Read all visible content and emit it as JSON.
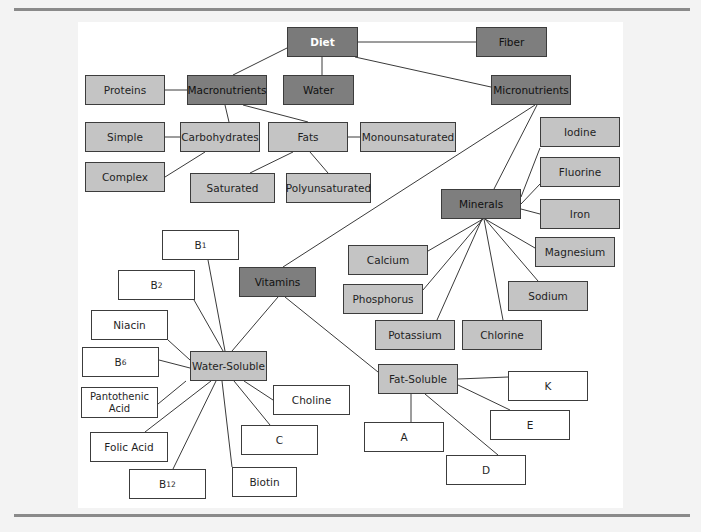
{
  "diagram": {
    "title": "Diet",
    "colors": {
      "dark_node": "#7a7a7a",
      "light_node": "#c4c4c4",
      "white_node": "#ffffff",
      "edge": "#3a3a3a",
      "rule": "#8a8a8a"
    },
    "nodes": {
      "diet": {
        "label": "Diet",
        "level": "root"
      },
      "fiber": {
        "label": "Fiber",
        "level": "category"
      },
      "water": {
        "label": "Water",
        "level": "category"
      },
      "macronutrients": {
        "label": "Macronutrients",
        "level": "category"
      },
      "micronutrients": {
        "label": "Micronutrients",
        "level": "category"
      },
      "proteins": {
        "label": "Proteins",
        "level": "subcategory"
      },
      "carbohydrates": {
        "label": "Carbohydrates",
        "level": "subcategory"
      },
      "fats": {
        "label": "Fats",
        "level": "subcategory"
      },
      "simple": {
        "label": "Simple",
        "level": "subcategory"
      },
      "complex": {
        "label": "Complex",
        "level": "subcategory"
      },
      "monounsaturated": {
        "label": "Monounsaturated",
        "level": "subcategory"
      },
      "saturated": {
        "label": "Saturated",
        "level": "subcategory"
      },
      "polyunsaturated": {
        "label": "Polyunsaturated",
        "level": "subcategory"
      },
      "minerals": {
        "label": "Minerals",
        "level": "category"
      },
      "iodine": {
        "label": "Iodine",
        "level": "subcategory"
      },
      "fluorine": {
        "label": "Fluorine",
        "level": "subcategory"
      },
      "iron": {
        "label": "Iron",
        "level": "subcategory"
      },
      "calcium": {
        "label": "Calcium",
        "level": "subcategory"
      },
      "magnesium": {
        "label": "Magnesium",
        "level": "subcategory"
      },
      "phosphorus": {
        "label": "Phosphorus",
        "level": "subcategory"
      },
      "sodium": {
        "label": "Sodium",
        "level": "subcategory"
      },
      "potassium": {
        "label": "Potassium",
        "level": "subcategory"
      },
      "chlorine": {
        "label": "Chlorine",
        "level": "subcategory"
      },
      "vitamins": {
        "label": "Vitamins",
        "level": "category"
      },
      "water_soluble": {
        "label": "Water-Soluble",
        "level": "subcategory"
      },
      "fat_soluble": {
        "label": "Fat-Soluble",
        "level": "subcategory"
      },
      "b1": {
        "label": "B",
        "sub": "1",
        "level": "leaf"
      },
      "b2": {
        "label": "B",
        "sub": "2",
        "level": "leaf"
      },
      "niacin": {
        "label": "Niacin",
        "level": "leaf"
      },
      "b6": {
        "label": "B",
        "sub": "6",
        "level": "leaf"
      },
      "pantothenic_acid": {
        "label": "Pantothenic Acid",
        "level": "leaf"
      },
      "folic_acid": {
        "label": "Folic Acid",
        "level": "leaf"
      },
      "b12": {
        "label": "B",
        "sub": "12",
        "level": "leaf"
      },
      "biotin": {
        "label": "Biotin",
        "level": "leaf"
      },
      "c": {
        "label": "C",
        "level": "leaf"
      },
      "choline": {
        "label": "Choline",
        "level": "leaf"
      },
      "a": {
        "label": "A",
        "level": "leaf"
      },
      "d": {
        "label": "D",
        "level": "leaf"
      },
      "e": {
        "label": "E",
        "level": "leaf"
      },
      "k": {
        "label": "K",
        "level": "leaf"
      }
    },
    "edges": [
      [
        "diet",
        "fiber"
      ],
      [
        "diet",
        "water"
      ],
      [
        "diet",
        "macronutrients"
      ],
      [
        "diet",
        "micronutrients"
      ],
      [
        "macronutrients",
        "proteins"
      ],
      [
        "macronutrients",
        "carbohydrates"
      ],
      [
        "macronutrients",
        "fats"
      ],
      [
        "carbohydrates",
        "simple"
      ],
      [
        "carbohydrates",
        "complex"
      ],
      [
        "fats",
        "monounsaturated"
      ],
      [
        "fats",
        "saturated"
      ],
      [
        "fats",
        "polyunsaturated"
      ],
      [
        "micronutrients",
        "minerals"
      ],
      [
        "micronutrients",
        "vitamins"
      ],
      [
        "minerals",
        "iodine"
      ],
      [
        "minerals",
        "fluorine"
      ],
      [
        "minerals",
        "iron"
      ],
      [
        "minerals",
        "calcium"
      ],
      [
        "minerals",
        "magnesium"
      ],
      [
        "minerals",
        "phosphorus"
      ],
      [
        "minerals",
        "sodium"
      ],
      [
        "minerals",
        "potassium"
      ],
      [
        "minerals",
        "chlorine"
      ],
      [
        "vitamins",
        "water_soluble"
      ],
      [
        "vitamins",
        "fat_soluble"
      ],
      [
        "water_soluble",
        "b1"
      ],
      [
        "water_soluble",
        "b2"
      ],
      [
        "water_soluble",
        "niacin"
      ],
      [
        "water_soluble",
        "b6"
      ],
      [
        "water_soluble",
        "pantothenic_acid"
      ],
      [
        "water_soluble",
        "folic_acid"
      ],
      [
        "water_soluble",
        "b12"
      ],
      [
        "water_soluble",
        "biotin"
      ],
      [
        "water_soluble",
        "c"
      ],
      [
        "water_soluble",
        "choline"
      ],
      [
        "fat_soluble",
        "a"
      ],
      [
        "fat_soluble",
        "d"
      ],
      [
        "fat_soluble",
        "e"
      ],
      [
        "fat_soluble",
        "k"
      ]
    ]
  }
}
